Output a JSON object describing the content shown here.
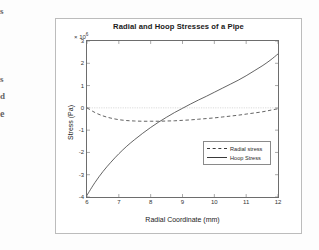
{
  "page": {
    "margin_fragments": [
      "s",
      "s",
      "d",
      "e"
    ]
  },
  "figure": {
    "title": "Radial and Hoop Stresses of a Pipe",
    "y_exponent_prefix": "× 10",
    "y_exponent_power": "6",
    "xlabel": "Radial Coordinate (mm)",
    "ylabel": "Stress (Pa)",
    "legend": {
      "items": [
        {
          "label": "Radial stress",
          "style": "dashed"
        },
        {
          "label": "Hoop Stress",
          "style": "solid"
        }
      ]
    }
  },
  "chart_data": {
    "type": "line",
    "title": "Radial and Hoop Stresses of a Pipe",
    "xlabel": "Radial Coordinate (mm)",
    "ylabel": "Stress (Pa)",
    "y_scale_note": "values in units of 1e6 Pa",
    "xlim": [
      6,
      12
    ],
    "ylim": [
      -4,
      3
    ],
    "xticks": [
      6,
      7,
      8,
      9,
      10,
      11,
      12
    ],
    "yticks": [
      -4,
      -3,
      -2,
      -1,
      0,
      1,
      2,
      3
    ],
    "grid": false,
    "legend_position": "lower right",
    "x": [
      6,
      6.25,
      6.5,
      6.75,
      7,
      7.25,
      7.5,
      7.75,
      8,
      8.25,
      8.5,
      8.75,
      9,
      9.25,
      9.5,
      9.75,
      10,
      10.25,
      10.5,
      10.75,
      11,
      11.25,
      11.5,
      11.75,
      12
    ],
    "series": [
      {
        "name": "Radial stress",
        "style": "dashed",
        "color": "#3a3a3a",
        "values": [
          0.0,
          -0.21,
          -0.36,
          -0.46,
          -0.53,
          -0.57,
          -0.59,
          -0.6,
          -0.6,
          -0.6,
          -0.59,
          -0.58,
          -0.56,
          -0.54,
          -0.51,
          -0.48,
          -0.45,
          -0.41,
          -0.37,
          -0.33,
          -0.28,
          -0.23,
          -0.18,
          -0.11,
          -0.04
        ]
      },
      {
        "name": "Hoop Stress",
        "style": "solid",
        "color": "#3a3a3a",
        "values": [
          -3.92,
          -3.35,
          -2.86,
          -2.44,
          -2.06,
          -1.72,
          -1.42,
          -1.14,
          -0.88,
          -0.64,
          -0.42,
          -0.21,
          -0.02,
          0.17,
          0.35,
          0.52,
          0.7,
          0.88,
          1.06,
          1.24,
          1.44,
          1.66,
          1.88,
          2.13,
          2.42
        ]
      }
    ],
    "zero_crossing_hoop_x": 9.05,
    "radial_minimum": {
      "x": 8.2,
      "y": -0.6
    }
  }
}
